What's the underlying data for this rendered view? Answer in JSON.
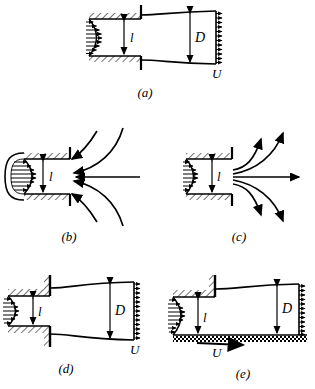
{
  "figure": {
    "type": "technical-line-diagram",
    "background_color": "#ffffff",
    "line_color": "#000000",
    "panel_count": 5
  },
  "panels": [
    {
      "id": "a",
      "caption": "(a)",
      "description": "Converging nozzle discharging a free jet that expands to diameter D with uniform exit velocity U",
      "labels": {
        "inlet_dimension": "l",
        "jet_dimension": "D",
        "exit_velocity": "U"
      },
      "features": {
        "inlet_profile": "parabolic",
        "wall_hatching": "diagonal",
        "jet_boundary": "expanding",
        "exit_profile": "uniform"
      }
    },
    {
      "id": "b",
      "caption": "(b)",
      "description": "Re-entrant tube with converging streamlines drawn inward toward the orifice from the surrounding fluid",
      "labels": {
        "inlet_dimension": "l"
      },
      "features": {
        "inlet_profile": "parabolic",
        "wall_hatching": "diagonal",
        "streamlines": "converging",
        "arrow_direction": "inward"
      }
    },
    {
      "id": "c",
      "caption": "(c)",
      "description": "Orifice with diverging streamlines spreading outward from the opening into the ambient fluid",
      "labels": {
        "inlet_dimension": "l"
      },
      "features": {
        "inlet_profile": "parabolic",
        "wall_hatching": "diagonal",
        "streamlines": "diverging",
        "arrow_direction": "outward"
      }
    },
    {
      "id": "d",
      "caption": "(d)",
      "description": "Abrupt expansion from a duct of height l into a free jet of diameter D leaving with velocity U",
      "labels": {
        "inlet_dimension": "l",
        "jet_dimension": "D",
        "exit_velocity": "U"
      },
      "features": {
        "inlet_profile": "parabolic",
        "wall_hatching": "diagonal",
        "jet_boundary": "expanding",
        "exit_profile": "uniform"
      }
    },
    {
      "id": "e",
      "caption": "(e)",
      "description": "Wall jet of height l along a moving stippled boundary translating at velocity U, expanding to depth D",
      "labels": {
        "inlet_dimension": "l",
        "jet_dimension": "D",
        "surface_velocity": "U"
      },
      "features": {
        "inlet_profile": "parabolic",
        "wall_hatching": "diagonal",
        "ground_texture": "stippled",
        "jet_boundary": "expanding",
        "exit_profile": "uniform"
      }
    }
  ]
}
